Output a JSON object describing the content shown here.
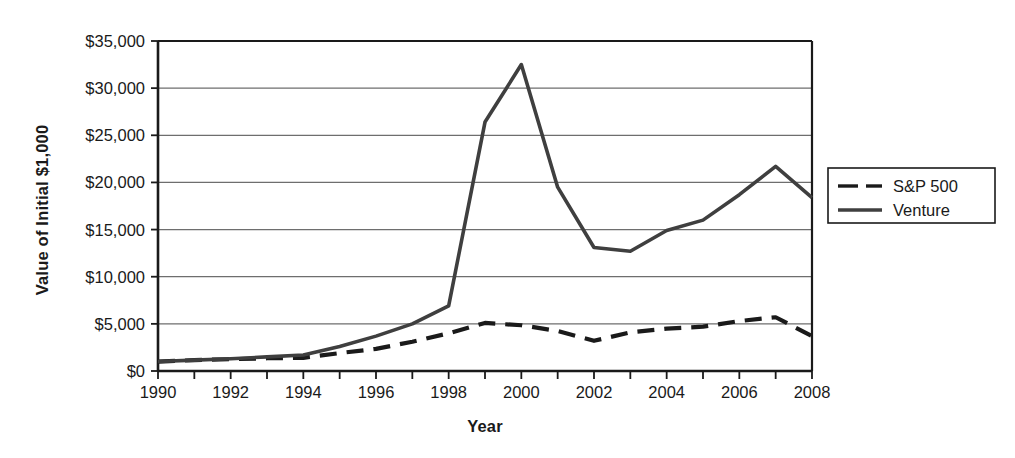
{
  "chart_data": {
    "type": "line",
    "title": "",
    "xlabel": "Year",
    "ylabel": "Value of Initial $1,000",
    "xlim": [
      1990,
      2008
    ],
    "ylim": [
      0,
      35000
    ],
    "grid": true,
    "grid_axis": "y",
    "legend_position": "right",
    "x": [
      1990,
      1991,
      1992,
      1993,
      1994,
      1995,
      1996,
      1997,
      1998,
      1999,
      2000,
      2001,
      2002,
      2003,
      2004,
      2005,
      2006,
      2007,
      2008
    ],
    "y_tick_labels": [
      "$0",
      "$5,000",
      "$10,000",
      "$15,000",
      "$20,000",
      "$25,000",
      "$30,000",
      "$35,000"
    ],
    "y_tick_values": [
      0,
      5000,
      10000,
      15000,
      20000,
      25000,
      30000,
      35000
    ],
    "x_tick_labels": [
      "1990",
      "1992",
      "1994",
      "1996",
      "1998",
      "2000",
      "2002",
      "2004",
      "2006",
      "2008"
    ],
    "x_tick_values": [
      1990,
      1992,
      1994,
      1996,
      1998,
      2000,
      2002,
      2004,
      2006,
      2008
    ],
    "series": [
      {
        "name": "S&P 500",
        "style": "dashed",
        "color": "#1a1a1a",
        "values": [
          1000,
          1150,
          1250,
          1350,
          1400,
          1900,
          2350,
          3100,
          4000,
          5100,
          4850,
          4250,
          3200,
          4100,
          4500,
          4700,
          5300,
          5700,
          3700
        ]
      },
      {
        "name": "Venture",
        "style": "solid",
        "color": "#3f3f3f",
        "values": [
          1000,
          1150,
          1300,
          1500,
          1700,
          2600,
          3700,
          5000,
          6900,
          26400,
          32500,
          19500,
          13100,
          12700,
          14900,
          16000,
          18700,
          21700,
          18400
        ]
      }
    ]
  },
  "legend": {
    "items": [
      {
        "label": "S&P 500",
        "style": "dashed"
      },
      {
        "label": "Venture",
        "style": "solid"
      }
    ]
  },
  "axes": {
    "y_title": "Value of Initial $1,000",
    "x_title": "Year"
  },
  "colors": {
    "background": "#ffffff",
    "axis": "#1a1a1a",
    "gridline": "#6e6e6e",
    "sp500": "#1a1a1a",
    "venture": "#3f3f3f"
  }
}
